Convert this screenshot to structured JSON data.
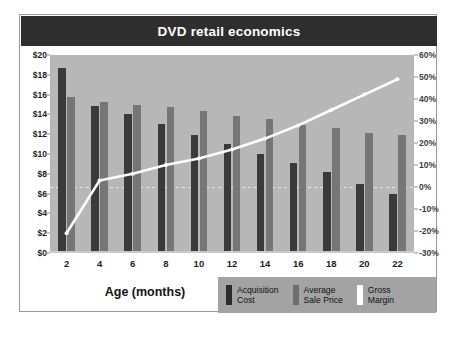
{
  "chart_data": {
    "type": "bar",
    "title": "DVD retail economics",
    "xlabel": "Age (months)",
    "ylabel": "",
    "categories": [
      "2",
      "4",
      "6",
      "8",
      "10",
      "12",
      "14",
      "16",
      "18",
      "20",
      "22"
    ],
    "x": [
      2,
      4,
      6,
      8,
      10,
      12,
      14,
      16,
      18,
      20,
      22
    ],
    "grid": false,
    "legend_position": "bottom-right",
    "left_axis": {
      "label": "",
      "ylim": [
        0,
        20
      ],
      "tick_step": 2,
      "ticks": [
        "$0",
        "$2",
        "$4",
        "$6",
        "$8",
        "$10",
        "$12",
        "$14",
        "$16",
        "$18",
        "$20"
      ],
      "tick_values": [
        0,
        2,
        4,
        6,
        8,
        10,
        12,
        14,
        16,
        18,
        20
      ]
    },
    "right_axis": {
      "label": "",
      "ylim": [
        -30,
        60
      ],
      "tick_step": 10,
      "ticks": [
        "-30%",
        "-20%",
        "-10%",
        "0%",
        "10%",
        "20%",
        "30%",
        "40%",
        "50%",
        "60%"
      ],
      "tick_values": [
        -30,
        -20,
        -10,
        0,
        10,
        20,
        30,
        40,
        50,
        60
      ]
    },
    "series": [
      {
        "name": "Acquisition Cost",
        "type": "bar",
        "axis": "left",
        "color": "#3a3a3a",
        "values": [
          18.7,
          14.8,
          14.0,
          13.0,
          11.9,
          11.0,
          10.0,
          9.1,
          8.2,
          7.0,
          6.0
        ]
      },
      {
        "name": "Average Sale Price",
        "type": "bar",
        "axis": "left",
        "color": "#767676",
        "values": [
          15.8,
          15.3,
          15.0,
          14.7,
          14.3,
          13.8,
          13.5,
          12.9,
          12.6,
          12.1,
          11.9
        ]
      },
      {
        "name": "Gross Margin",
        "type": "line",
        "axis": "right",
        "color": "#ffffff",
        "values": [
          -21,
          3,
          6,
          10,
          13,
          17,
          22,
          28,
          35,
          42,
          49
        ]
      }
    ]
  },
  "legend": [
    {
      "label": "Acquisition\nCost",
      "swatch": "sw-cost",
      "icon": "bar-swatch-dark"
    },
    {
      "label": "Average\nSale Price",
      "swatch": "sw-price",
      "icon": "bar-swatch-gray"
    },
    {
      "label": "Gross\nMargin",
      "swatch": "sw-margin",
      "icon": "line-swatch-white"
    }
  ],
  "colors": {
    "title_bar": "#2e2e2e",
    "plot_background": "#b7b7b7",
    "legend_background": "#a3a3a3",
    "card_background": "#ffffff",
    "acquisition_cost": "#3a3a3a",
    "average_sale_price": "#767676",
    "gross_margin": "#ffffff"
  }
}
